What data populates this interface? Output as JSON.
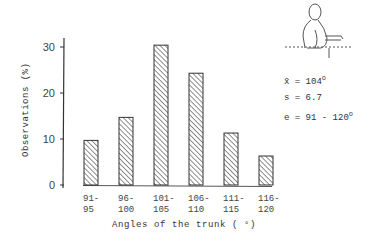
{
  "chart_data": {
    "type": "bar",
    "title": "",
    "xlabel": "Angles of the trunk ( °)",
    "ylabel": "Observations (%)",
    "categories": [
      "91-95",
      "96-100",
      "101-105",
      "106-110",
      "111-115",
      "116-120"
    ],
    "values": [
      9.7,
      14.7,
      30.4,
      24.3,
      11.3,
      6.3
    ],
    "yticks": [
      0,
      10,
      20,
      30
    ],
    "ylim": [
      0,
      32
    ],
    "grid": false,
    "legend": null,
    "bar_fill": "diagonal-hatch",
    "annotations": [
      "x̄ = 104°",
      "s = 6.7",
      "e = 91 - 120°"
    ]
  },
  "labels": {
    "ylabel": "Observations (%)",
    "xlabel": "Angles of the trunk ( °)"
  },
  "stats": {
    "mean_symbol": "x̄",
    "mean_value": "= 104",
    "sd_label": "s",
    "sd_value": "= 6.7",
    "range_label": "e",
    "range_value": "= 91 - 120"
  }
}
